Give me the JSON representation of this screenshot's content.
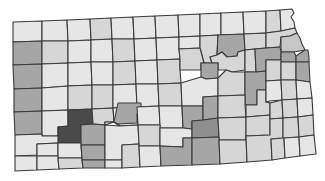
{
  "map": {
    "subject": "Kansas counties choropleth",
    "legend_visible": false,
    "color_scale": {
      "l0": "#e6e6e6",
      "l1": "#d6d6d6",
      "l2": "#c6c6c6",
      "l3": "#a6a6a6",
      "l4": "#8f8f8f",
      "l5": "#4a4a4a"
    },
    "border_color": "#3a3a3a",
    "counties": [
      {
        "pts": "13,22 42,21 42,41 13,42",
        "lvl": "l0"
      },
      {
        "pts": "42,21 67,20 68,41 42,41",
        "lvl": "l0"
      },
      {
        "pts": "67,20 90,19 91,40 68,41",
        "lvl": "l0"
      },
      {
        "pts": "90,19 111,18 112,39 91,40",
        "lvl": "l1"
      },
      {
        "pts": "111,18 133,17 134,39 112,39",
        "lvl": "l0"
      },
      {
        "pts": "133,17 155,16 156,38 134,39",
        "lvl": "l0"
      },
      {
        "pts": "155,16 178,15 179,37 156,38",
        "lvl": "l0"
      },
      {
        "pts": "178,15 200,14 200,36 179,37",
        "lvl": "l0"
      },
      {
        "pts": "200,14 221,13 221,35 200,36",
        "lvl": "l0"
      },
      {
        "pts": "221,13 243,12 244,34 221,35",
        "lvl": "l0"
      },
      {
        "pts": "243,12 266,11 266,33 244,34",
        "lvl": "l0"
      },
      {
        "pts": "266,11 280,10 281,31 266,33",
        "lvl": "l1"
      },
      {
        "pts": "280,10 292,9 294,13 291,17 294,22 295,28 281,31",
        "lvl": "l0"
      },
      {
        "pts": "13,42 42,41 42,64 13,65",
        "lvl": "l3"
      },
      {
        "pts": "42,41 68,41 68,63 42,64",
        "lvl": "l1"
      },
      {
        "pts": "68,41 91,40 91,62 68,63",
        "lvl": "l0"
      },
      {
        "pts": "91,40 112,39 113,62 91,62",
        "lvl": "l0"
      },
      {
        "pts": "112,39 134,39 135,61 113,62",
        "lvl": "l1"
      },
      {
        "pts": "134,39 156,38 157,60 135,61",
        "lvl": "l0"
      },
      {
        "pts": "156,38 179,37 179,49 180,59 157,60",
        "lvl": "l0"
      },
      {
        "pts": "179,37 200,36 200,48 179,49",
        "lvl": "l0"
      },
      {
        "pts": "200,36 218,35 217,55 210,57 212,63 204,63 200,48",
        "lvl": "l1"
      },
      {
        "pts": "218,35 244,34 245,50 238,52 237,56 227,57 222,52 217,55",
        "lvl": "l3"
      },
      {
        "pts": "244,34 266,33 266,48 255,49 245,50",
        "lvl": "l1"
      },
      {
        "pts": "266,33 281,31 295,28 297,33 290,36 281,37 280,47 266,48",
        "lvl": "l1"
      },
      {
        "pts": "281,37 290,36 297,33 300,38 302,44 305,50 294,52 281,52",
        "lvl": "l2"
      },
      {
        "pts": "13,65 42,64 42,88 14,89",
        "lvl": "l3"
      },
      {
        "pts": "42,64 68,63 68,86 42,88",
        "lvl": "l0"
      },
      {
        "pts": "68,63 91,62 92,85 68,86",
        "lvl": "l0"
      },
      {
        "pts": "91,62 113,62 113,85 92,85",
        "lvl": "l0"
      },
      {
        "pts": "113,62 135,61 136,84 113,85",
        "lvl": "l1"
      },
      {
        "pts": "135,61 157,60 158,84 136,84",
        "lvl": "l0"
      },
      {
        "pts": "157,60 180,59 180,70 181,83 158,84",
        "lvl": "l1"
      },
      {
        "pts": "180,59 179,49 200,48 204,63 201,63 201,70 180,70",
        "lvl": "l1"
      },
      {
        "pts": "222,52 227,57 237,56 238,52 245,50 245,70 232,72 226,70 218,70 218,63 212,63 210,57 217,55",
        "lvl": "l1"
      },
      {
        "pts": "201,63 212,63 218,63 218,70 218,78 206,79 201,77 201,70",
        "lvl": "l3"
      },
      {
        "pts": "245,50 255,49 256,72 245,72 245,70",
        "lvl": "l1"
      },
      {
        "pts": "255,49 266,48 280,47 281,52 281,60 266,60 266,71 256,72",
        "lvl": "l3"
      },
      {
        "pts": "281,52 294,52 296,56 296,62 281,62 281,60",
        "lvl": "l3"
      },
      {
        "pts": "296,56 305,50 308,50 309,58 309,62 296,62",
        "lvl": "l3"
      },
      {
        "pts": "14,89 42,88 42,111 14,112",
        "lvl": "l3"
      },
      {
        "pts": "42,88 68,86 68,110 42,111",
        "lvl": "l0"
      },
      {
        "pts": "68,86 92,85 92,109 68,110",
        "lvl": "l1"
      },
      {
        "pts": "92,85 113,85 113,108 92,109",
        "lvl": "l1"
      },
      {
        "pts": "113,85 136,84 137,107 113,108",
        "lvl": "l0"
      },
      {
        "pts": "136,84 158,84 159,106 137,107",
        "lvl": "l0"
      },
      {
        "pts": "158,84 181,83 182,106 159,106",
        "lvl": "l1"
      },
      {
        "pts": "181,83 201,77 206,79 218,78 218,96 203,97 203,106 182,106",
        "lvl": "l0"
      },
      {
        "pts": "218,78 226,70 232,72 245,72 245,95 218,96",
        "lvl": "l1"
      },
      {
        "pts": "245,72 256,72 266,71 266,90 257,90 257,105 245,105 245,95",
        "lvl": "l3"
      },
      {
        "pts": "266,71 266,60 281,60 281,62 281,80 266,81",
        "lvl": "l1"
      },
      {
        "pts": "281,62 296,62 296,80 281,80",
        "lvl": "l1"
      },
      {
        "pts": "296,62 309,62 310,82 296,80",
        "lvl": "l3"
      },
      {
        "pts": "14,112 42,111 42,134 15,135",
        "lvl": "l3"
      },
      {
        "pts": "42,111 68,110 68,126 58,127 58,136 42,136 42,134",
        "lvl": "l0"
      },
      {
        "pts": "58,127 68,126 68,110 92,109 93,124 81,125 81,143 58,143 58,136",
        "lvl": "l5"
      },
      {
        "pts": "92,109 113,108 114,122 105,122 105,125 93,124",
        "lvl": "l1"
      },
      {
        "pts": "81,125 93,124 105,125 105,145 81,145 81,143",
        "lvl": "l3"
      },
      {
        "pts": "105,125 105,122 114,122 113,108 137,107 138,125 119,126 119,121 114,122",
        "lvl": "l0"
      },
      {
        "pts": "119,121 119,126 114,122 119,121",
        "lvl": "l3"
      },
      {
        "pts": "114,122 118,103 141,103 141,114 137,114 137,123 118,124",
        "lvl": "l3"
      },
      {
        "pts": "137,107 159,106 160,125 138,125",
        "lvl": "l0"
      },
      {
        "pts": "159,106 182,106 183,128 160,128 160,125",
        "lvl": "l0"
      },
      {
        "pts": "182,106 203,106 203,120 192,121 192,129 183,128",
        "lvl": "l3"
      },
      {
        "pts": "203,106 203,97 218,96 218,118 203,120",
        "lvl": "l3"
      },
      {
        "pts": "218,96 245,95 245,105 246,117 218,118",
        "lvl": "l1"
      },
      {
        "pts": "246,105 257,105 257,90 266,90 266,102 270,103 270,115 246,117",
        "lvl": "l1"
      },
      {
        "pts": "266,81 281,80 282,100 270,101 266,102",
        "lvl": "l0"
      },
      {
        "pts": "281,80 296,80 297,99 282,100",
        "lvl": "l1"
      },
      {
        "pts": "296,80 310,82 312,98 297,99",
        "lvl": "l0"
      },
      {
        "pts": "15,135 42,134 42,136 58,136 58,143 37,144 37,155 15,156",
        "lvl": "l0"
      },
      {
        "pts": "37,144 58,143 58,156 37,156",
        "lvl": "l0"
      },
      {
        "pts": "58,143 81,143 81,145 82,158 58,158 58,156",
        "lvl": "l0"
      },
      {
        "pts": "81,145 105,145 105,160 82,160 82,158",
        "lvl": "l3"
      },
      {
        "pts": "105,145 105,125 119,126 138,125 139,144 122,145 122,160 105,160",
        "lvl": "l0"
      },
      {
        "pts": "138,125 160,125 160,128 160,146 139,146 139,144",
        "lvl": "l1"
      },
      {
        "pts": "160,128 183,128 192,129 192,138 183,138 183,147 160,146",
        "lvl": "l0"
      },
      {
        "pts": "192,121 203,120 218,118 219,137 192,138 192,129",
        "lvl": "l4"
      },
      {
        "pts": "218,118 246,117 246,140 219,140 219,137",
        "lvl": "l1"
      },
      {
        "pts": "246,117 270,115 270,135 246,136",
        "lvl": "l1"
      },
      {
        "pts": "270,103 282,100 283,118 270,119 270,115",
        "lvl": "l1"
      },
      {
        "pts": "282,100 297,99 298,117 283,118",
        "lvl": "l1"
      },
      {
        "pts": "297,99 312,98 313,115 298,117",
        "lvl": "l0"
      },
      {
        "pts": "15,156 37,156 37,170 15,171",
        "lvl": "l0"
      },
      {
        "pts": "37,156 58,156 58,158 59,169 37,170",
        "lvl": "l0"
      },
      {
        "pts": "58,158 82,158 82,160 83,168 59,169",
        "lvl": "l1"
      },
      {
        "pts": "82,160 105,160 105,168 83,168",
        "lvl": "l3"
      },
      {
        "pts": "105,160 122,160 122,168 105,168",
        "lvl": "l0"
      },
      {
        "pts": "122,145 139,144 139,146 140,167 122,168 122,160",
        "lvl": "l1"
      },
      {
        "pts": "139,146 160,146 161,166 140,167",
        "lvl": "l0"
      },
      {
        "pts": "160,146 183,147 183,138 192,138 192,165 161,166",
        "lvl": "l3"
      },
      {
        "pts": "192,138 219,137 219,140 220,164 192,165",
        "lvl": "l3"
      },
      {
        "pts": "219,140 246,140 246,136 247,162 220,164",
        "lvl": "l1"
      },
      {
        "pts": "246,136 270,135 270,119 283,118 283,138 271,139 272,160 247,162",
        "lvl": "l1"
      },
      {
        "pts": "271,139 283,138 283,118 298,117 299,137 284,138 285,158 272,160",
        "lvl": "l1"
      },
      {
        "pts": "298,117 313,115 314,135 299,137",
        "lvl": "l1"
      },
      {
        "pts": "284,138 299,137 300,156 285,158",
        "lvl": "l0"
      },
      {
        "pts": "299,137 314,135 316,154 300,156",
        "lvl": "l0"
      }
    ]
  }
}
